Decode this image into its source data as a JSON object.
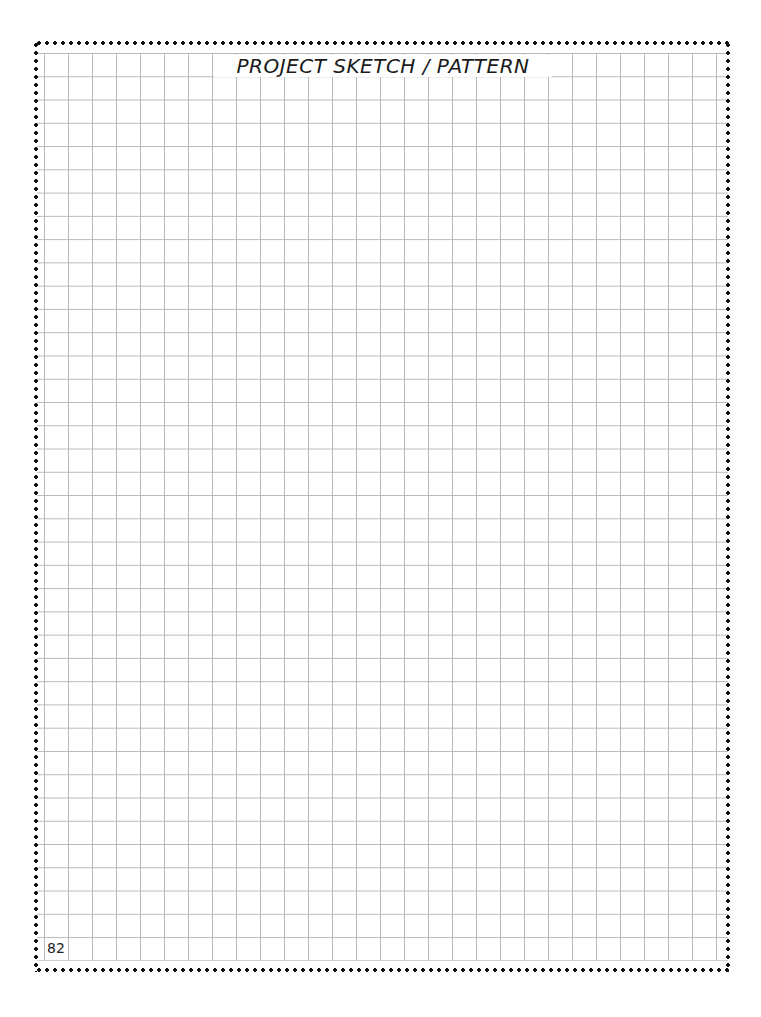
{
  "page": {
    "title": "PROJECT SKETCH / PATTERN",
    "page_number": "82",
    "grid": {
      "columns": 28,
      "rows": 39,
      "line_color": "#b9b9b9"
    },
    "border": {
      "style": "dotted",
      "color": "#111111"
    }
  }
}
